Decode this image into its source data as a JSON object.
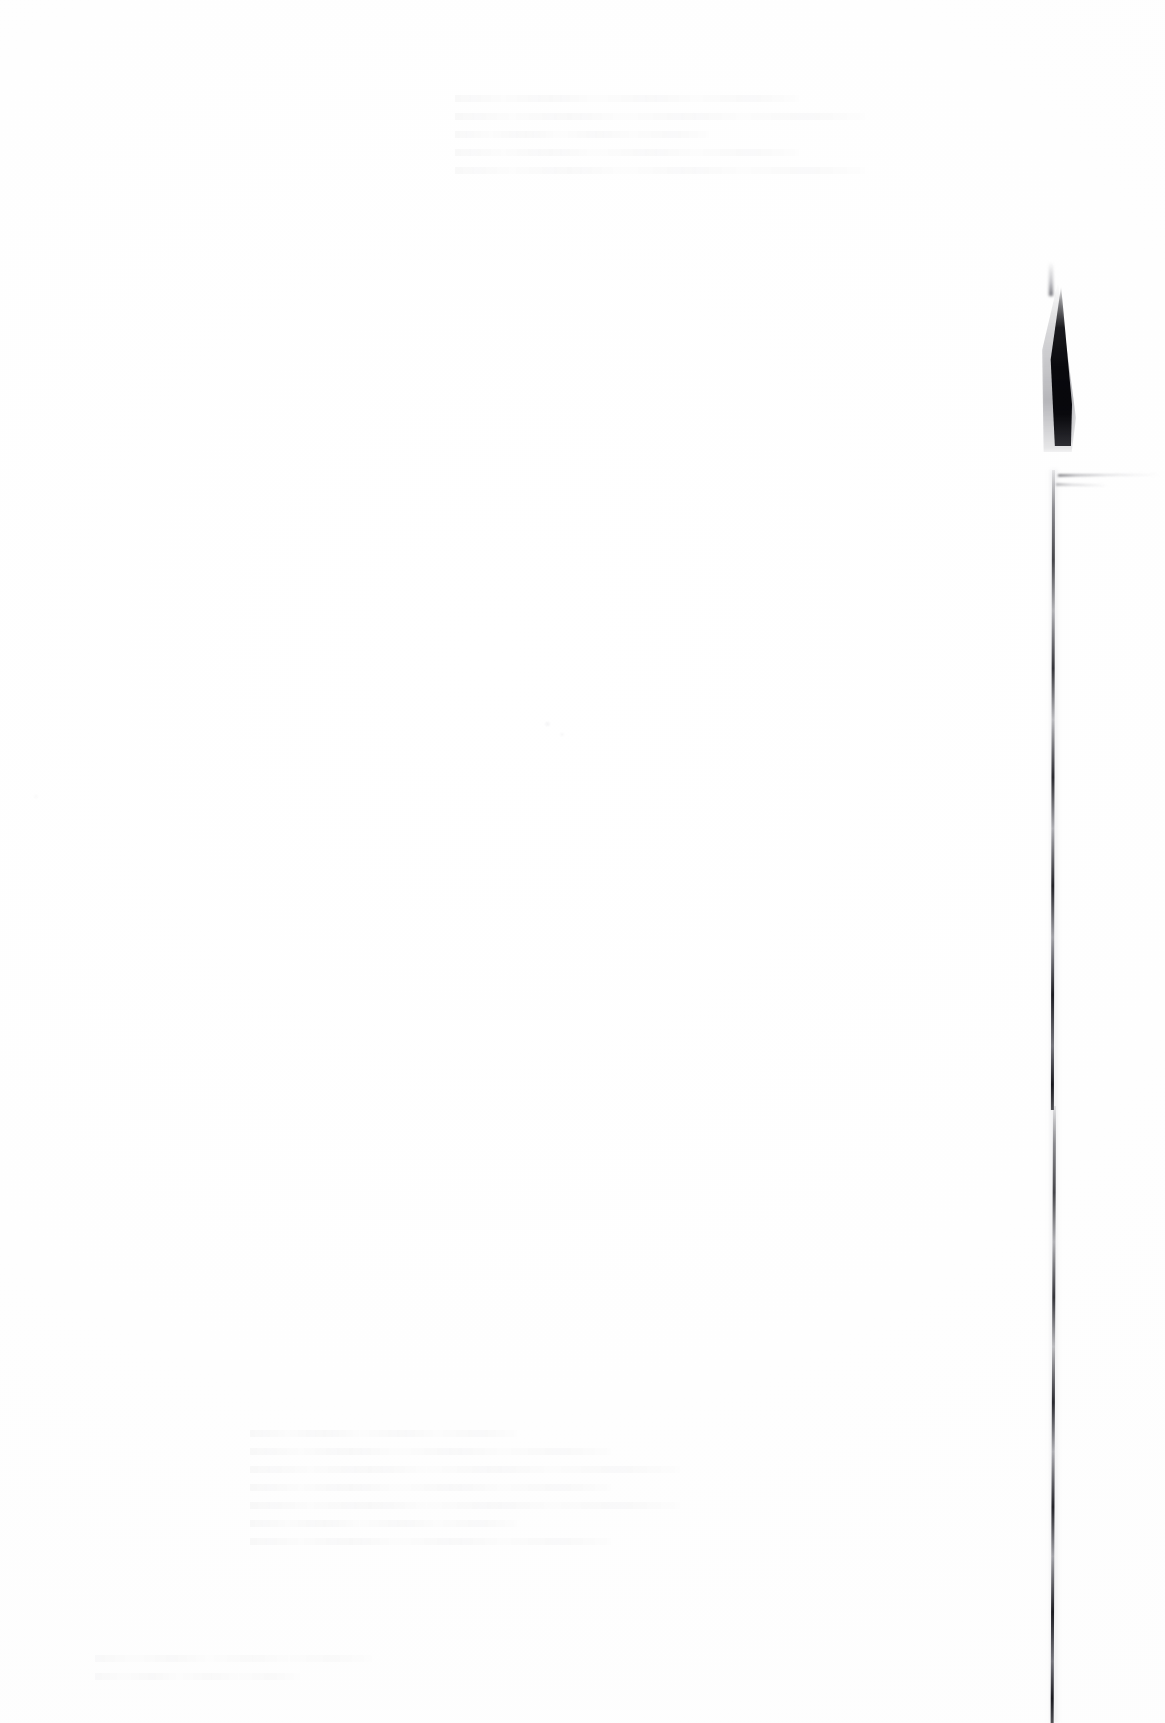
{
  "document": {
    "kind": "scanned-page",
    "content_state": "blank",
    "page_background_color": "#ffffff",
    "artifact_ink_color": "#0a0a0e",
    "width_px": 1165,
    "height_px": 1723
  },
  "ghost_heading": {
    "text": "",
    "left_px": 340,
    "top_px": 702,
    "note": "bleed-through ghost, illegible"
  },
  "ghost_blocks": [
    {
      "name": "ghost-text-top",
      "left_px": 455,
      "top_px": 95,
      "width_px": 410,
      "lines": 5
    },
    {
      "name": "ghost-text-middle",
      "left_px": 250,
      "top_px": 1430,
      "width_px": 430,
      "lines": 7
    },
    {
      "name": "ghost-text-lower",
      "left_px": 95,
      "top_px": 1655,
      "width_px": 330,
      "lines": 2
    }
  ],
  "artifacts": {
    "edge_line": {
      "name": "page-edge-line",
      "top_px": 470,
      "bottom_px": 1723,
      "x_top_px": 1052,
      "x_bottom_px": 1057
    },
    "edge_wedge": {
      "name": "folded-corner-wedge",
      "left_px": 1046,
      "top_px": 286,
      "width_px": 26,
      "height_px": 160
    },
    "fold_wisp": {
      "name": "fold-crease-wisp",
      "left_px": 1058,
      "top_px": 474,
      "width_px": 104
    }
  }
}
